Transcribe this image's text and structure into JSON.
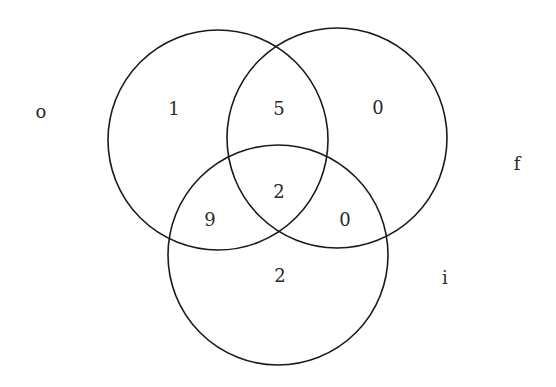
{
  "diagram": {
    "type": "venn",
    "sets": [
      {
        "id": "o",
        "label": "o",
        "cx": 218,
        "cy": 140,
        "r": 110,
        "label_x": 41,
        "label_y": 113
      },
      {
        "id": "f",
        "label": "f",
        "cx": 337,
        "cy": 138,
        "r": 110,
        "label_x": 517,
        "label_y": 165
      },
      {
        "id": "i",
        "label": "i",
        "cx": 278,
        "cy": 255,
        "r": 110,
        "label_x": 445,
        "label_y": 279
      }
    ],
    "regions": [
      {
        "id": "o_only",
        "sets": [
          "o"
        ],
        "value": "1",
        "x": 174,
        "y": 110
      },
      {
        "id": "o_f",
        "sets": [
          "o",
          "f"
        ],
        "value": "5",
        "x": 279,
        "y": 110
      },
      {
        "id": "f_only",
        "sets": [
          "f"
        ],
        "value": "0",
        "x": 378,
        "y": 109
      },
      {
        "id": "o_f_i",
        "sets": [
          "o",
          "f",
          "i"
        ],
        "value": "2",
        "x": 279,
        "y": 193
      },
      {
        "id": "o_i",
        "sets": [
          "o",
          "i"
        ],
        "value": "9",
        "x": 210,
        "y": 221
      },
      {
        "id": "f_i",
        "sets": [
          "f",
          "i"
        ],
        "value": "0",
        "x": 345,
        "y": 221
      },
      {
        "id": "i_only",
        "sets": [
          "i"
        ],
        "value": "2",
        "x": 280,
        "y": 277
      }
    ],
    "stroke_color": "#1a1a1a",
    "text_color": "#2a2a2a"
  }
}
